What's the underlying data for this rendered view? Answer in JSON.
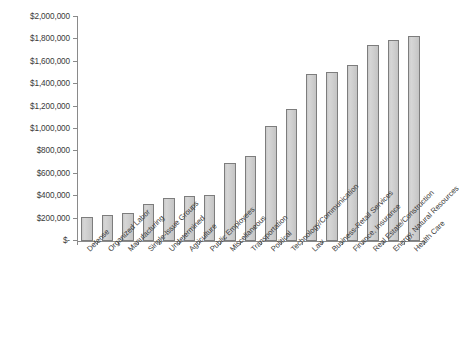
{
  "chart_data": {
    "type": "bar",
    "title": "",
    "subtitle": "",
    "xlabel": "",
    "ylabel": "",
    "ylim": [
      0,
      2000000
    ],
    "ytick_values": [
      0,
      200000,
      400000,
      600000,
      800000,
      1000000,
      1200000,
      1400000,
      1600000,
      1800000,
      2000000
    ],
    "ytick_labels": [
      "$-",
      "$200,000",
      "$400,000",
      "$600,000",
      "$800,000",
      "$1,000,000",
      "$1,200,000",
      "$1,400,000",
      "$1,600,000",
      "$1,800,000",
      "$2,000,000"
    ],
    "grid": false,
    "legend": "none",
    "bar_fill_color": "#cccccc",
    "bar_border_color": "#7d7d7d",
    "axis_color": "#8a8a8a",
    "categories": [
      "Defense",
      "Organized Labor",
      "Manufacturing",
      "Single-Issue Groups",
      "Undetermined",
      "Agriculture",
      "Public Employees",
      "Miscellaneous",
      "Transportation",
      "Political",
      "Technology/Communication",
      "Law",
      "Business-Retail Services",
      "Finance, Insurance",
      "Real Estate/Construction",
      "Energy, Natural Resources",
      "Health Care"
    ],
    "values": [
      210000,
      228000,
      248000,
      330000,
      382000,
      400000,
      408000,
      700000,
      755000,
      1030000,
      1175000,
      1490000,
      1512000,
      1570000,
      1750000,
      1795000,
      1828000
    ]
  }
}
